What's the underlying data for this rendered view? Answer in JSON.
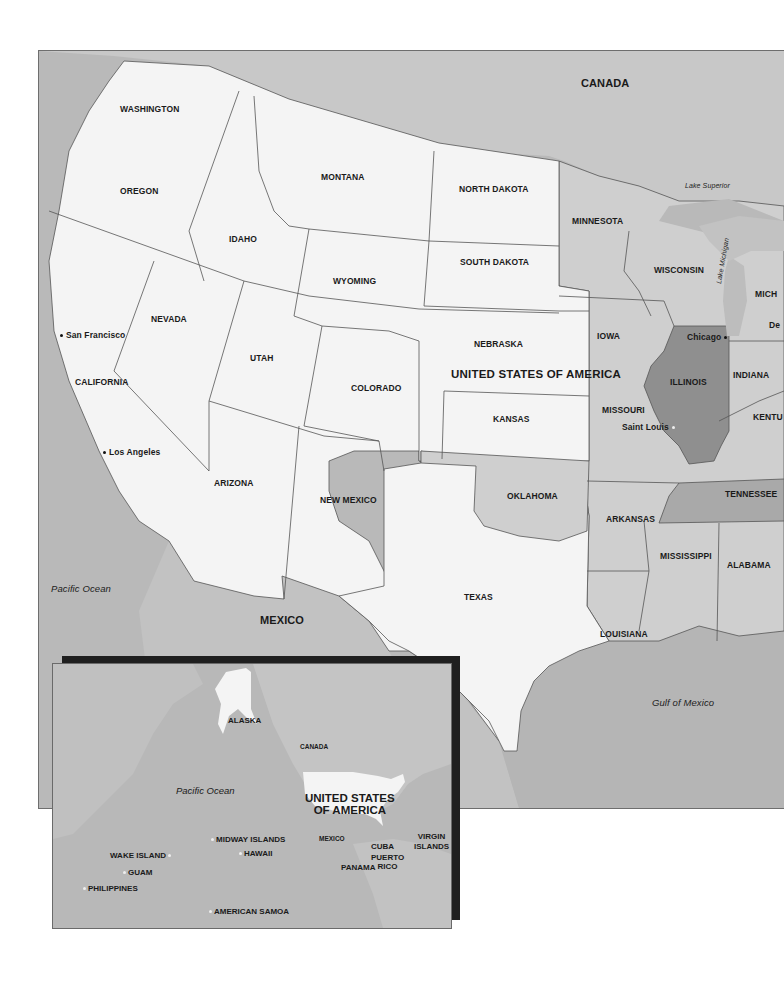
{
  "map": {
    "title": "United States of America",
    "colors": {
      "ocean": "#b9b9b9",
      "foreign_land": "#c4c4c4",
      "west_states": "#f4f4f4",
      "central_states": "#cfcfcf",
      "highlighted_state": "#8f8f8f",
      "border_line": "#555555",
      "inset_shadow": "#1f1f1f"
    },
    "countries": {
      "canada": "CANADA",
      "mexico": "MEXICO",
      "usa": "UNITED STATES OF AMERICA"
    },
    "water_bodies": {
      "pacific": "Pacific Ocean",
      "gulf": "Gulf of Mexico",
      "lake_superior": "Lake Superior",
      "lake_michigan": "Lake Michigan"
    },
    "states": {
      "washington": "WASHINGTON",
      "oregon": "OREGON",
      "idaho": "IDAHO",
      "montana": "MONTANA",
      "north_dakota": "NORTH DAKOTA",
      "minnesota": "MINNESOTA",
      "wisconsin": "WISCONSIN",
      "michigan_partial": "MICH",
      "detroit_partial": "De",
      "south_dakota": "SOUTH DAKOTA",
      "wyoming": "WYOMING",
      "nevada": "NEVADA",
      "california": "CALIFORNIA",
      "utah": "UTAH",
      "colorado": "COLORADO",
      "nebraska": "NEBRASKA",
      "iowa": "IOWA",
      "illinois": "ILLINOIS",
      "indiana": "INDIANA",
      "kansas": "KANSAS",
      "missouri": "MISSOURI",
      "kentucky_partial": "KENTU",
      "arizona": "ARIZONA",
      "new_mexico": "NEW MEXICO",
      "oklahoma": "OKLAHOMA",
      "tennessee": "TENNESSEE",
      "arkansas": "ARKANSAS",
      "mississippi": "MISSISSIPPI",
      "alabama": "ALABAMA",
      "texas": "TEXAS",
      "louisiana": "LOUISIANA"
    },
    "cities": {
      "san_francisco": "San Francisco",
      "los_angeles": "Los Angeles",
      "chicago": "Chicago",
      "saint_louis": "Saint Louis"
    }
  },
  "inset": {
    "labels": {
      "alaska": "ALASKA",
      "canada": "CANADA",
      "pacific": "Pacific Ocean",
      "usa_line1": "UNITED STATES",
      "usa_line2": "OF AMERICA",
      "mexico": "MEXICO",
      "cuba": "CUBA",
      "puerto_rico_line1": "PUERTO",
      "puerto_rico_line2": "RICO",
      "virgin_line1": "VIRGIN",
      "virgin_line2": "ISLANDS",
      "panama": "PANAMA",
      "midway": "MIDWAY ISLANDS",
      "hawaii": "HAWAII",
      "wake": "WAKE ISLAND",
      "guam": "GUAM",
      "philippines": "PHILIPPINES",
      "american_samoa": "AMERICAN SAMOA"
    }
  }
}
